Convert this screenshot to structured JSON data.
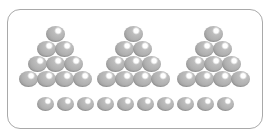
{
  "canvas": {
    "background": "#ffffff"
  },
  "frame": {
    "border_color": "#a9a9a9",
    "corner_radius_px": 13
  },
  "marble_colors": {
    "body": "#b0b0b0",
    "mid": "#bdbdbd",
    "edge": "#8c8c8c",
    "highlight": "#ffffff"
  },
  "figure": {
    "pyramids": [
      {
        "name": "pyramid-1",
        "center_x": 55,
        "rows": [
          1,
          2,
          3,
          4
        ],
        "marble_count": 10
      },
      {
        "name": "pyramid-2",
        "center_x": 133,
        "rows": [
          1,
          2,
          3,
          4
        ],
        "marble_count": 10
      },
      {
        "name": "pyramid-3",
        "center_x": 213,
        "rows": [
          1,
          2,
          3,
          4
        ],
        "marble_count": 10
      }
    ],
    "pyramid_layout": {
      "top_row_center_y": 34,
      "row_spacing_y": 15,
      "marble_spacing_x": 18,
      "marble_width": 19,
      "marble_height": 16
    },
    "bottom_row": {
      "name": "bottom-row",
      "marble_count": 10,
      "first_center_x": 45,
      "spacing_x": 20,
      "center_y": 104,
      "marble_width": 17,
      "marble_height": 14
    },
    "total_marbles": 40
  }
}
